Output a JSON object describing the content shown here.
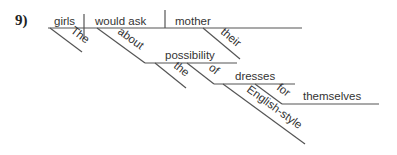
{
  "problem_number": "9)",
  "words": {
    "subject": "girls",
    "subject_modifier": "The",
    "verb": "would ask",
    "direct_object": "mother",
    "object_modifier": "their",
    "preposition_1": "about",
    "object_of_prep_1": "possibility",
    "prep_1_object_modifier": "the",
    "preposition_2": "of",
    "object_of_prep_2": "dresses",
    "prep_2_object_modifier": "English-style",
    "preposition_3": "for",
    "object_of_prep_3": "themselves"
  }
}
